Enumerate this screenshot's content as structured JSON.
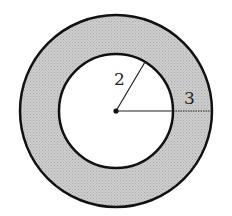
{
  "diagram": {
    "type": "annulus",
    "inner_radius_label": "2",
    "outer_width_label": "3",
    "colors": {
      "fill": "#c8c8c8",
      "stroke": "#111111",
      "background": "#ffffff"
    }
  }
}
